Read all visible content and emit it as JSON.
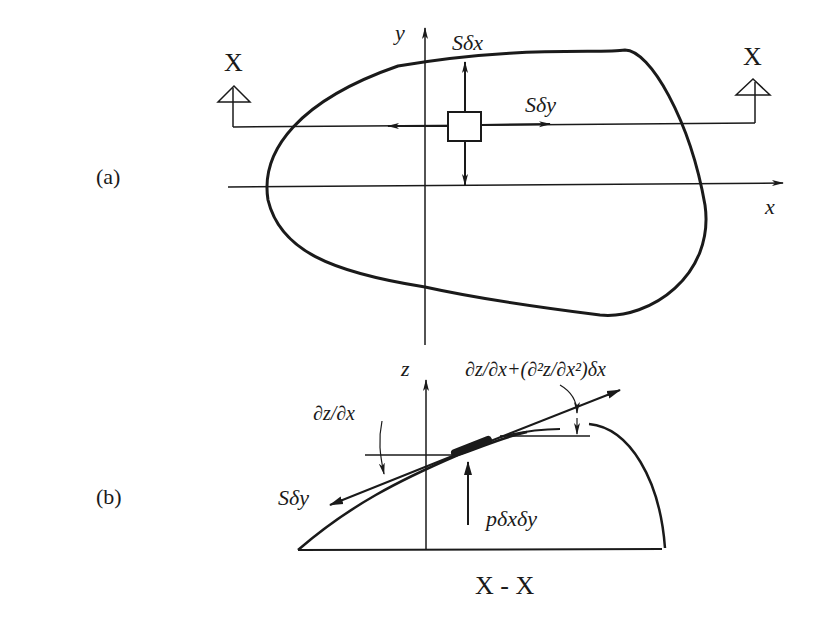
{
  "figure": {
    "panel_a": {
      "label": "(a)",
      "section_marker_left": "X",
      "section_marker_right": "X",
      "axis_y": "y",
      "axis_x": "x",
      "force_top": "Sδx",
      "force_right": "Sδy"
    },
    "panel_b": {
      "label": "(b)",
      "axis_z": "z",
      "slope_left": "∂z/∂x",
      "slope_right": "∂z/∂x+(∂²z/∂x²)δx",
      "force_left": "Sδy",
      "pressure_force": "pδxδy",
      "section_title": "X - X"
    },
    "colors": {
      "ink": "#1a1a1a",
      "background": "#ffffff"
    }
  }
}
